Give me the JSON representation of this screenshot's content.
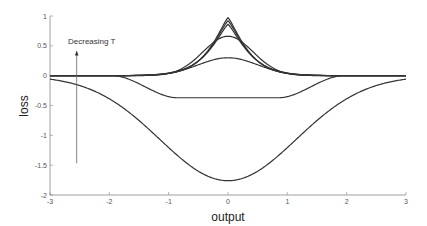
{
  "chart_data": {
    "type": "line",
    "title": "",
    "xlabel": "output",
    "ylabel": "loss",
    "xlim": [
      -3,
      3
    ],
    "ylim": [
      -2,
      1
    ],
    "xticks": [
      -3,
      -2,
      -1,
      0,
      1,
      2,
      3
    ],
    "yticks": [
      1,
      0.5,
      0,
      -0.5,
      -1,
      -1.5,
      -2
    ],
    "xtick_labels": [
      "-3",
      "-2",
      "-1",
      "0",
      "1",
      "2",
      "3"
    ],
    "ytick_labels": [
      "1",
      "0.5",
      "0",
      "-0.5",
      "-1",
      "-1.5",
      "-2"
    ],
    "grid": false,
    "legend": null,
    "annotation": {
      "text": "Decreasing T",
      "arrow": {
        "x": -2.55,
        "y_from": -1.47,
        "y_to": 0.42
      }
    },
    "series": [
      {
        "name": "T1 (highest)",
        "shape": "gaussian",
        "peak": -1.76,
        "width": 1.15
      },
      {
        "name": "T2",
        "shape": "flat-dip",
        "peak": -0.37,
        "flat_half_width": 0.85,
        "edge": 1.95
      },
      {
        "name": "T3",
        "shape": "gaussian",
        "peak": 0.3,
        "width": 0.5
      },
      {
        "name": "T4",
        "shape": "gaussian",
        "peak": 0.66,
        "width": 0.42
      },
      {
        "name": "T5",
        "shape": "laplace",
        "peak": 0.86,
        "width": 0.45
      },
      {
        "name": "T6",
        "shape": "laplace",
        "peak": 0.92,
        "width": 0.43
      },
      {
        "name": "T7 (lowest)",
        "shape": "laplace",
        "peak": 0.97,
        "width": 0.42
      }
    ],
    "line_color": "#333333"
  }
}
